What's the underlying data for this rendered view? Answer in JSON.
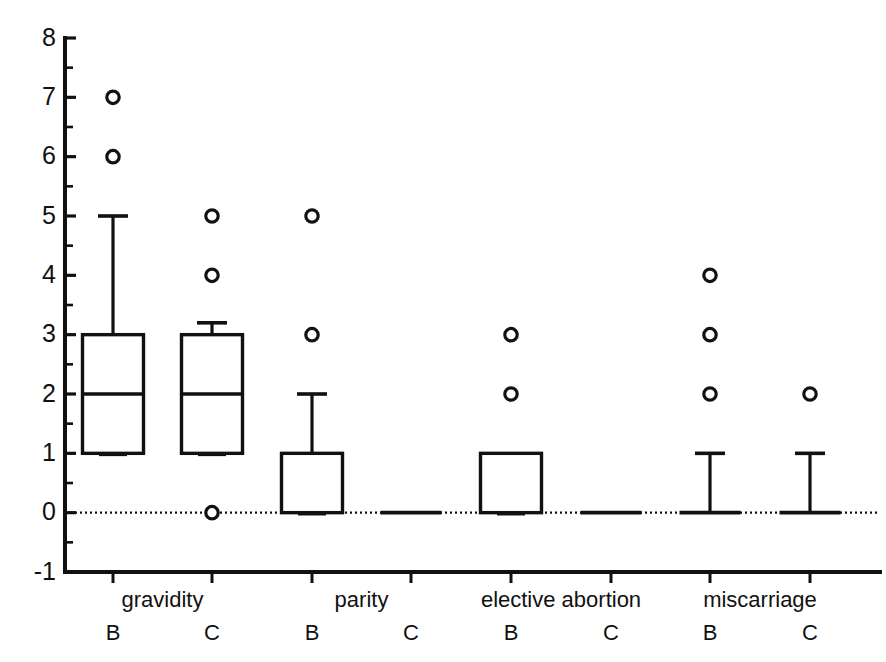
{
  "chart_data": {
    "type": "box",
    "title": "",
    "xlabel": "",
    "ylabel": "",
    "ylim": [
      -1,
      8
    ],
    "y_ticks": [
      -1,
      0,
      1,
      2,
      3,
      4,
      5,
      6,
      7,
      8
    ],
    "y_tick_labels": [
      "-1",
      "0",
      "1",
      "2",
      "3",
      "4",
      "5",
      "6",
      "7",
      "8"
    ],
    "y_minor_ticks": [
      -0.5,
      0.5,
      1.5,
      2.5,
      3.5,
      4.5,
      5.5,
      6.5,
      7.5
    ],
    "grid": false,
    "legend": "none",
    "zero_reference_line": {
      "value": 0,
      "style": "dotted"
    },
    "groups": [
      "gravidity",
      "parity",
      "elective abortion",
      "miscarriage"
    ],
    "subgroups": [
      "B",
      "C"
    ],
    "categories": [
      "gravidity B",
      "gravidity C",
      "parity B",
      "parity C",
      "elective abortion B",
      "elective abortion C",
      "miscarriage B",
      "miscarriage C"
    ],
    "boxes": [
      {
        "group": "gravidity",
        "subgroup": "B",
        "q1": 1,
        "median": 2,
        "q3": 3,
        "whisker_low": 1,
        "whisker_high": 5,
        "outliers": [
          7,
          6
        ]
      },
      {
        "group": "gravidity",
        "subgroup": "C",
        "q1": 1,
        "median": 2,
        "q3": 3,
        "whisker_low": 1,
        "whisker_high": 3.2,
        "outliers": [
          5,
          4,
          0
        ]
      },
      {
        "group": "parity",
        "subgroup": "B",
        "q1": 0,
        "median": 0,
        "q3": 1,
        "whisker_low": 0,
        "whisker_high": 2,
        "outliers": [
          5,
          3
        ]
      },
      {
        "group": "parity",
        "subgroup": "C",
        "q1": 0,
        "median": 0,
        "q3": 0,
        "whisker_low": 0,
        "whisker_high": 0,
        "outliers": []
      },
      {
        "group": "elective abortion",
        "subgroup": "B",
        "q1": 0,
        "median": 0,
        "q3": 1,
        "whisker_low": 0,
        "whisker_high": 1,
        "outliers": [
          3,
          2
        ]
      },
      {
        "group": "elective abortion",
        "subgroup": "C",
        "q1": 0,
        "median": 0,
        "q3": 0,
        "whisker_low": 0,
        "whisker_high": 0,
        "outliers": []
      },
      {
        "group": "miscarriage",
        "subgroup": "B",
        "q1": 0,
        "median": 0,
        "q3": 0,
        "whisker_low": 0,
        "whisker_high": 1,
        "outliers": [
          4,
          3,
          2
        ]
      },
      {
        "group": "miscarriage",
        "subgroup": "C",
        "q1": 0,
        "median": 0,
        "q3": 0,
        "whisker_low": 0,
        "whisker_high": 1,
        "outliers": [
          2
        ]
      }
    ],
    "group_labels": [
      {
        "text": "gravidity",
        "center_category_index": 0.5
      },
      {
        "text": "parity",
        "center_category_index": 2.5
      },
      {
        "text": "elective abortion",
        "center_category_index": 4.5
      },
      {
        "text": "miscarriage",
        "center_category_index": 6.5
      }
    ],
    "sub_labels": [
      "B",
      "C",
      "B",
      "C",
      "B",
      "C",
      "B",
      "C"
    ]
  },
  "axes": {
    "y_axis_name": "value-axis",
    "x_axis_name": "category-axis"
  }
}
